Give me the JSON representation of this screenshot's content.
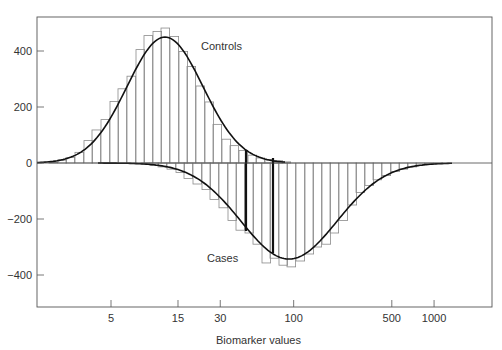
{
  "chart_data": {
    "type": "bar",
    "subtype": "mirrored histogram with fitted curves (log x-axis)",
    "title": "",
    "xlabel": "Biomarker values",
    "ylabel": "",
    "x_scale": "log",
    "x_ticks": [
      5,
      15,
      30,
      100,
      500,
      1000
    ],
    "x_tick_labels": [
      "5",
      "15",
      "30",
      "100",
      "500",
      "1000"
    ],
    "y_ticks": [
      400,
      200,
      0,
      -200,
      -400
    ],
    "y_tick_labels": [
      "400",
      "200",
      "0",
      "−200",
      "−400"
    ],
    "ylim": [
      -514,
      521
    ],
    "grid": false,
    "legend": null,
    "annotations": [
      {
        "text": "Controls",
        "x_px": 201,
        "y_px": 50
      },
      {
        "text": "Cases",
        "x_px": 207,
        "y_px": 258
      }
    ],
    "series": [
      {
        "name": "Controls",
        "direction": "up",
        "bin_left_px": [
          49,
          58,
          66,
          75,
          84,
          92,
          101,
          110,
          118,
          127,
          136,
          144,
          153,
          161,
          170,
          179,
          187,
          196,
          205,
          213,
          222,
          230,
          239,
          248,
          256,
          265,
          274,
          282
        ],
        "values": [
          3,
          10,
          20,
          38,
          80,
          118,
          155,
          220,
          265,
          310,
          405,
          455,
          470,
          482,
          452,
          398,
          345,
          275,
          218,
          138,
          85,
          62,
          45,
          28,
          18,
          12,
          8,
          4
        ],
        "fit_peak_value": 450,
        "fit_peak_biomarker": 14
      },
      {
        "name": "Cases",
        "direction": "down",
        "bin_left_px": [
          141,
          150,
          158,
          167,
          176,
          184,
          193,
          202,
          210,
          219,
          228,
          236,
          245,
          253,
          262,
          270,
          279,
          287,
          296,
          305,
          313,
          322,
          330,
          339,
          348,
          356,
          365,
          373,
          382,
          391,
          399,
          408,
          416,
          425,
          434
        ],
        "values": [
          3,
          8,
          14,
          22,
          34,
          55,
          75,
          95,
          130,
          160,
          205,
          240,
          250,
          290,
          357,
          340,
          365,
          371,
          350,
          325,
          300,
          290,
          250,
          205,
          150,
          105,
          80,
          60,
          45,
          30,
          22,
          14,
          8,
          4,
          2
        ],
        "fit_peak_value": -343,
        "fit_peak_biomarker": 85
      }
    ],
    "highlight_lines": [
      {
        "x_px": 246,
        "y_top": 150,
        "y_bottom": 231
      },
      {
        "x_px": 273,
        "y_top": 158,
        "y_bottom": 253
      }
    ]
  },
  "labels": {
    "x_axis_title": "Biomarker values",
    "controls": "Controls",
    "cases": "Cases"
  }
}
